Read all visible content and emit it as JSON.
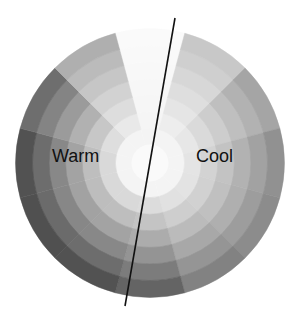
{
  "diagram": {
    "type": "grayscale-color-wheel",
    "center": [
      150,
      163
    ],
    "core_radius": 18,
    "outer_radius": 134,
    "rings": 7,
    "wedges": 12,
    "wedge_start_angle_deg": -15,
    "inner_gray": 244,
    "core_color": "#fafafa",
    "outer_grays_by_wedge": [
      250,
      200,
      165,
      145,
      140,
      130,
      100,
      82,
      80,
      82,
      110,
      175
    ],
    "divider": {
      "x1": 175,
      "y1": 18,
      "x2": 125,
      "y2": 306,
      "color": "#111111",
      "width": 1.6
    }
  },
  "labels": {
    "warm": "Warm",
    "cool": "Cool"
  },
  "colors": {
    "background": "#ffffff",
    "text": "#111111"
  }
}
